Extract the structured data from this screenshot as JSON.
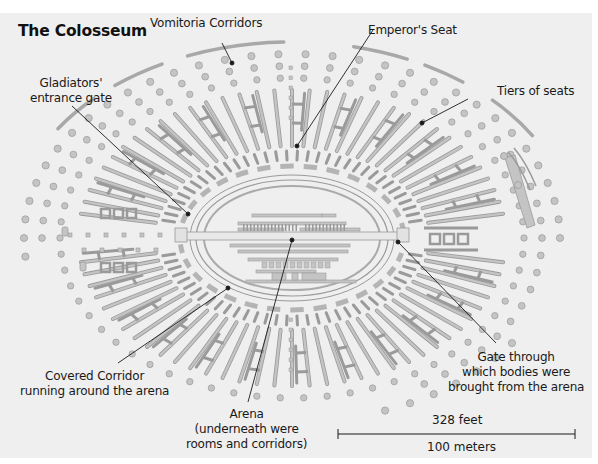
{
  "title": "The Colosseum",
  "labels": {
    "vomitoria": "Vomitoria Corridors",
    "emperor": "Emperor's Seat",
    "gladiators_line1": "Gladiators'",
    "gladiators_line2": "entrance gate",
    "tiers": "Tiers of seats",
    "corridor_line1": "Covered Corridor",
    "corridor_line2": "running around the arena",
    "gate_line1": "Gate through",
    "gate_line2": "which bodies were",
    "gate_line3": "brought from the arena",
    "arena_line1": "Arena",
    "arena_line2": "(underneath were",
    "arena_line3": "rooms and corridors)"
  },
  "scale": {
    "feet": "328 feet",
    "meters": "100 meters"
  },
  "colors": {
    "background": "#efefef",
    "structure_fill": "#c4c4c4",
    "structure_stroke": "#9a9a9a",
    "leader_line": "#1a1a1a"
  }
}
